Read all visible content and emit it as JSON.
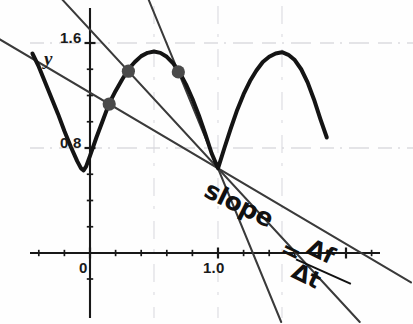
{
  "chart_data": {
    "type": "line",
    "title": "",
    "xlabel": "",
    "ylabel": "y",
    "xlim": [
      -0.5,
      2.05
    ],
    "ylim": [
      0.0,
      1.78
    ],
    "grid": "faint remnants of horizontal gridlines at y=1.6 and y=0.8",
    "legend": null,
    "axis": {
      "y_axis_label": "y",
      "y_tick_labels": [
        "1.6",
        "0.8"
      ],
      "y_tick_values": [
        1.6,
        0.8
      ],
      "y_minor_tick_spacing": 0.2,
      "x_tick_labels": [
        "0",
        "1.0"
      ],
      "x_tick_values": [
        0.0,
        1.0
      ],
      "x_minor_tick_spacing": 0.2,
      "origin_label": "0"
    },
    "annotations": [
      {
        "name": "slope-formula",
        "text": "slope = Δf/Δt",
        "word": "slope",
        "equals": "=",
        "numerator": "Δf",
        "denominator": "Δt",
        "rotation_deg": 26
      }
    ],
    "series": [
      {
        "name": "f(t) piecewise arch curve",
        "type": "line",
        "color": "#141414",
        "width": 4,
        "points": [
          [
            -0.45,
            1.52
          ],
          [
            -0.4,
            1.42
          ],
          [
            -0.35,
            1.3
          ],
          [
            -0.3,
            1.18
          ],
          [
            -0.25,
            1.06
          ],
          [
            -0.2,
            0.93
          ],
          [
            -0.15,
            0.81
          ],
          [
            -0.1,
            0.7
          ],
          [
            -0.07,
            0.645
          ],
          [
            -0.05,
            0.63
          ],
          [
            -0.03,
            0.66
          ],
          [
            0.0,
            0.74
          ],
          [
            0.05,
            0.88
          ],
          [
            0.1,
            1.01
          ],
          [
            0.15,
            1.14
          ],
          [
            0.2,
            1.235
          ],
          [
            0.25,
            1.32
          ],
          [
            0.3,
            1.4
          ],
          [
            0.35,
            1.455
          ],
          [
            0.4,
            1.5
          ],
          [
            0.45,
            1.525
          ],
          [
            0.5,
            1.535
          ],
          [
            0.55,
            1.525
          ],
          [
            0.6,
            1.495
          ],
          [
            0.65,
            1.445
          ],
          [
            0.7,
            1.375
          ],
          [
            0.75,
            1.285
          ],
          [
            0.8,
            1.175
          ],
          [
            0.85,
            1.05
          ],
          [
            0.9,
            0.91
          ],
          [
            0.95,
            0.76
          ],
          [
            1.0,
            0.645
          ],
          [
            1.05,
            0.8
          ],
          [
            1.1,
            0.95
          ],
          [
            1.15,
            1.09
          ],
          [
            1.2,
            1.21
          ],
          [
            1.25,
            1.31
          ],
          [
            1.3,
            1.39
          ],
          [
            1.35,
            1.455
          ],
          [
            1.4,
            1.495
          ],
          [
            1.45,
            1.52
          ],
          [
            1.5,
            1.53
          ],
          [
            1.55,
            1.51
          ],
          [
            1.6,
            1.47
          ],
          [
            1.65,
            1.4
          ],
          [
            1.7,
            1.3
          ],
          [
            1.75,
            1.17
          ],
          [
            1.8,
            1.02
          ],
          [
            1.85,
            0.88
          ]
        ]
      }
    ],
    "marked_points": [
      {
        "name": "secant-point-1",
        "x": 0.15,
        "y": 1.135
      },
      {
        "name": "secant-point-2",
        "x": 0.3,
        "y": 1.385
      },
      {
        "name": "secant-point-3",
        "x": 0.69,
        "y": 1.38
      }
    ],
    "secant_lines": [
      {
        "name": "secant-line-1",
        "from": [
          0.15,
          1.135
        ],
        "through": [
          1.0,
          0.645
        ],
        "color": "#3a3a3a",
        "width": 2
      },
      {
        "name": "secant-line-2",
        "from": [
          0.3,
          1.385
        ],
        "through": [
          1.0,
          0.645
        ],
        "color": "#3a3a3a",
        "width": 2
      },
      {
        "name": "secant-line-3",
        "from": [
          0.69,
          1.38
        ],
        "through": [
          1.0,
          0.645
        ],
        "color": "#3a3a3a",
        "width": 2
      }
    ],
    "convergence_point": {
      "x": 1.0,
      "y": 0.645,
      "description": "all secant lines pass through the corner minimum at t=1.0"
    }
  },
  "labels": {
    "y_axis": "y",
    "y_top": "1.6",
    "y_mid": "0.8",
    "x_origin": "0",
    "x_one": "1.0",
    "slope_word": "slope",
    "slope_equals": "=",
    "slope_numerator": "Δf",
    "slope_denominator": "Δt"
  }
}
